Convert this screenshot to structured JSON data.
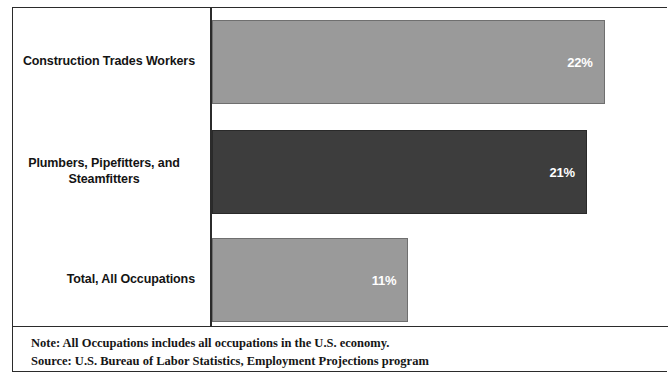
{
  "chart_data": {
    "type": "bar",
    "orientation": "horizontal",
    "title": "",
    "subtitle": "",
    "xlabel": "",
    "ylabel": "",
    "categories": [
      "Construction Trades Workers",
      "Plumbers, Pipefitters, and Steamfitters",
      "Total, All Occupations"
    ],
    "category_lines": [
      [
        "Construction Trades Workers"
      ],
      [
        "Plumbers, Pipefitters, and",
        "Steamfitters"
      ],
      [
        "Total, All Occupations"
      ]
    ],
    "values": [
      22,
      21,
      11
    ],
    "value_labels": [
      "22%",
      "21%",
      "11%"
    ],
    "bar_colors": [
      "#9a9a9a",
      "#3d3d3d",
      "#9a9a9a"
    ],
    "xlim": [
      0,
      22.8
    ],
    "grid": false,
    "legend": false,
    "axis_color": "#2b2b2b"
  },
  "footnote": {
    "note": "Note: All Occupations includes all occupations in the U.S. economy.",
    "source": "Source: U.S. Bureau of Labor Statistics, Employment Projections program"
  }
}
